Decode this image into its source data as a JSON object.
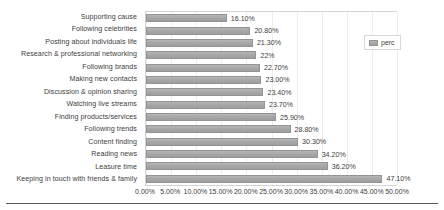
{
  "chart_data": {
    "type": "bar",
    "orientation": "horizontal",
    "title": "",
    "xlabel": "",
    "ylabel": "",
    "xlim": [
      0,
      50
    ],
    "grid": true,
    "legend_position": "top-right",
    "legend": [
      "perc"
    ],
    "series": [
      {
        "name": "perc",
        "color": "#a6a6a6",
        "values": [
          16.1,
          20.8,
          21.3,
          22,
          22.7,
          23.0,
          23.4,
          23.7,
          25.9,
          28.8,
          30.3,
          34.2,
          36.2,
          47.1
        ]
      }
    ],
    "categories": [
      "Supporting cause",
      "Following celebrities",
      "Posting about individuals life",
      "Research & professional networking",
      "Following brands",
      "Making new contacts",
      "Discussion & opinion sharing",
      "Watching live streams",
      "Finding products/services",
      "Following trends",
      "Content finding",
      "Reading news",
      "Leasure time",
      "Keeping in touch with friends & family"
    ],
    "data_labels": [
      "16.10%",
      "20.80%",
      "21.30%",
      "22%",
      "22.70%",
      "23.00%",
      "23.40%",
      "23.70%",
      "25.90%",
      "28.80%",
      "30.30%",
      "34.20%",
      "36.20%",
      "47.10%"
    ],
    "x_tick_values": [
      0,
      5,
      10,
      15,
      20,
      25,
      30,
      35,
      40,
      45,
      50
    ],
    "x_tick_labels": [
      "0.00%",
      "5.00%",
      "10.00%",
      "15.00%",
      "20.00%",
      "25.00%",
      "30.00%",
      "35.00%",
      "40.00%",
      "45.00%",
      "50.00%"
    ]
  },
  "colors": {
    "bar": "#a6a6a6",
    "bar_border": "#949494",
    "plot_border": "#d4d4d4",
    "gridline": "#ededed",
    "text": "#3d3d3d",
    "bottom_rule": "#5b5b5b"
  }
}
